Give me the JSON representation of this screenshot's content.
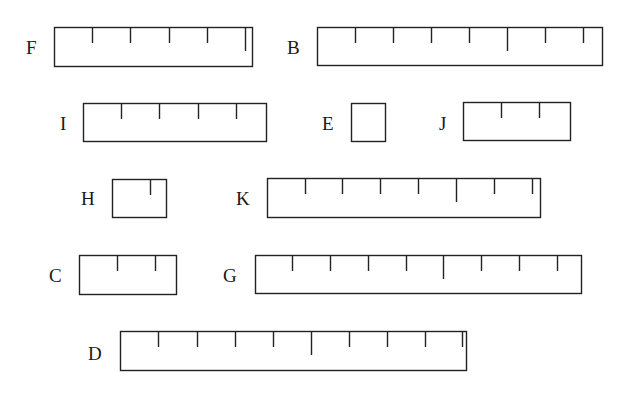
{
  "rulers": [
    {
      "label": "F",
      "label_x": 26,
      "label_y": 38,
      "x1": 54,
      "y1": 27,
      "x2": 252,
      "y2": 66,
      "ticks": [
        92,
        130,
        169,
        207,
        245
      ],
      "long_ticks": [
        245
      ]
    },
    {
      "label": "B",
      "label_x": 287,
      "label_y": 38,
      "x1": 317,
      "y1": 27,
      "x2": 602,
      "y2": 65,
      "ticks": [
        355,
        393,
        431,
        469,
        507,
        545,
        583
      ],
      "long_ticks": [
        507
      ]
    },
    {
      "label": "I",
      "label_x": 60,
      "label_y": 114,
      "x1": 83,
      "y1": 103,
      "x2": 266,
      "y2": 141,
      "ticks": [
        121,
        159,
        198,
        236
      ],
      "long_ticks": []
    },
    {
      "label": "E",
      "label_x": 322,
      "label_y": 114,
      "x1": 351,
      "y1": 103,
      "x2": 385,
      "y2": 141,
      "ticks": [],
      "long_ticks": []
    },
    {
      "label": "J",
      "label_x": 439,
      "label_y": 114,
      "x1": 463,
      "y1": 102,
      "x2": 570,
      "y2": 140,
      "ticks": [
        501,
        539
      ],
      "long_ticks": []
    },
    {
      "label": "H",
      "label_x": 81,
      "label_y": 189,
      "x1": 112,
      "y1": 179,
      "x2": 166,
      "y2": 217,
      "ticks": [
        150
      ],
      "long_ticks": []
    },
    {
      "label": "K",
      "label_x": 236,
      "label_y": 189,
      "x1": 267,
      "y1": 178,
      "x2": 540,
      "y2": 217,
      "ticks": [
        305,
        342,
        380,
        418,
        456,
        494,
        532
      ],
      "long_ticks": [
        456
      ]
    },
    {
      "label": "C",
      "label_x": 49,
      "label_y": 266,
      "x1": 79,
      "y1": 255,
      "x2": 176,
      "y2": 294,
      "ticks": [
        117,
        155
      ],
      "long_ticks": []
    },
    {
      "label": "G",
      "label_x": 223,
      "label_y": 266,
      "x1": 255,
      "y1": 255,
      "x2": 581,
      "y2": 293,
      "ticks": [
        292,
        330,
        368,
        406,
        443,
        481,
        519,
        557
      ],
      "long_ticks": [
        443
      ]
    },
    {
      "label": "D",
      "label_x": 88,
      "label_y": 344,
      "x1": 120,
      "y1": 331,
      "x2": 466,
      "y2": 370,
      "ticks": [
        158,
        197,
        235,
        273,
        311,
        349,
        387,
        425,
        462
      ],
      "long_ticks": [
        311
      ]
    }
  ]
}
